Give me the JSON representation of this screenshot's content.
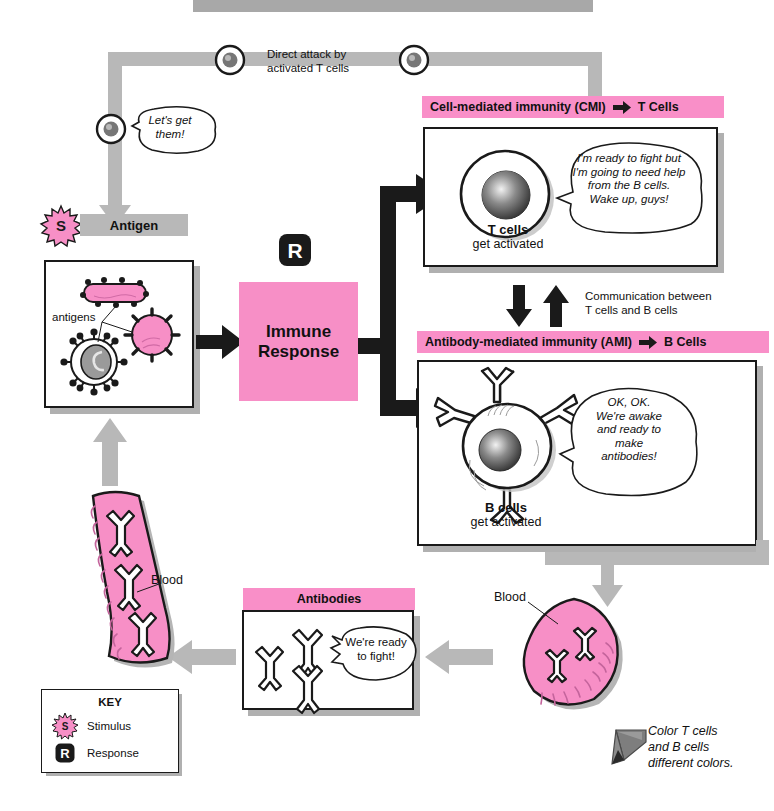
{
  "colors": {
    "pink_header": "#f98fc8",
    "pink_fill": "#f78fc6",
    "gray_arrow": "#b8b8b8",
    "gray_label": "#b8b8b8",
    "shadow": "#b0b0b0",
    "black": "#1a1a1a"
  },
  "top_banner": {
    "text": ""
  },
  "feedback_loop": {
    "direct_attack_label_line1": "Direct attack by",
    "direct_attack_label_line2": "activated T cells",
    "tcell_bubble_line1": "Let's get",
    "tcell_bubble_line2": "them!",
    "tcell_markers": [
      "t-cell-marker-1",
      "t-cell-marker-2",
      "t-cell-marker-3"
    ]
  },
  "antigen": {
    "badge": "S",
    "title": "Antigen",
    "inner_label": "antigens",
    "pathogens": [
      "rod-bacterium",
      "round-pathogen",
      "virus-particle"
    ]
  },
  "immune_response": {
    "badge": "R",
    "line1": "Immune",
    "line2": "Response"
  },
  "cmi": {
    "header_text": "Cell-mediated immunity (CMI)",
    "header_arrow": "right-arrow-icon",
    "header_target": "T Cells",
    "caption_bold": "T cells",
    "caption_normal": "get activated",
    "bubble_lines": [
      "I'm ready to fight but",
      "I'm going to need help",
      "from the B cells.",
      "Wake up, guys!"
    ]
  },
  "communication": {
    "line1": "Communication between",
    "line2": "T cells and B cells"
  },
  "ami": {
    "header_text": "Antibody-mediated immunity (AMI)",
    "header_arrow": "right-arrow-icon",
    "header_target": "B Cells",
    "caption_bold": "B cells",
    "caption_normal": "get activated",
    "bubble_lines": [
      "OK, OK.",
      "We're awake",
      "and ready to",
      "make",
      "antibodies!"
    ]
  },
  "antibodies": {
    "header_text": "Antibodies",
    "bubble_line1": "We're ready",
    "bubble_line2": "to fight!",
    "count": 3
  },
  "blood_right": {
    "label": "Blood"
  },
  "blood_left": {
    "label": "Blood",
    "antibody_count": 3
  },
  "key": {
    "title": "KEY",
    "items": [
      {
        "badge": "S",
        "label": "Stimulus",
        "shape": "starburst"
      },
      {
        "badge": "R",
        "label": "Response",
        "shape": "rounded-square"
      }
    ]
  },
  "crayon_note": {
    "line1": "Color T cells",
    "line2": "and B cells",
    "line3": "different colors."
  }
}
